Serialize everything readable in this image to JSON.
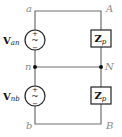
{
  "diagram": {
    "type": "circuit",
    "nodes": {
      "a": "a",
      "A": "A",
      "n": "n",
      "N": "N",
      "b": "b",
      "B": "B"
    },
    "sources": [
      {
        "label_main": "V",
        "label_sub": "an",
        "plus": "+",
        "minus": "−",
        "symbol": "~"
      },
      {
        "label_main": "V",
        "label_sub": "nb",
        "plus": "+",
        "minus": "−",
        "symbol": "~"
      }
    ],
    "impedances": [
      {
        "label_main": "Z",
        "label_sub": "p"
      },
      {
        "label_main": "Z",
        "label_sub": "p"
      }
    ],
    "colors": {
      "wire": "#6e6e6e",
      "component": "#222222",
      "node_label": "#8a8a8a"
    }
  }
}
